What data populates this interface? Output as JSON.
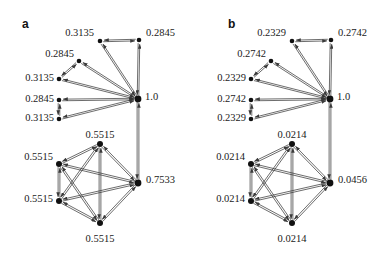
{
  "figure": {
    "width": 384,
    "height": 255,
    "background": "#ffffff",
    "ink_color": "#333333",
    "node_color": "#111111",
    "text_color": "#1a1a1a"
  },
  "panels": [
    {
      "id": "a",
      "label": "a",
      "label_x": 22,
      "label_y": 18,
      "clusters": [
        {
          "id": "a-upper-star",
          "type": "star",
          "hub": {
            "id": "a-hub",
            "x": 138,
            "y": 99,
            "r": 3.4,
            "label": "1.0",
            "label_x": 145,
            "label_y": 97,
            "anchor": "start"
          },
          "leaves": [
            {
              "id": "a-leaf-1",
              "x": 100,
              "y": 41,
              "r": 2.3,
              "label": "0.3135",
              "label_x": 94,
              "label_y": 33,
              "anchor": "end"
            },
            {
              "id": "a-leaf-2",
              "x": 139,
              "y": 40,
              "r": 2.3,
              "label": "0.2845",
              "label_x": 146,
              "label_y": 33,
              "anchor": "start"
            },
            {
              "id": "a-leaf-3",
              "x": 79,
              "y": 61,
              "r": 2.3,
              "label": "0.2845",
              "label_x": 74,
              "label_y": 54,
              "anchor": "end"
            },
            {
              "id": "a-leaf-4",
              "x": 59,
              "y": 79,
              "r": 2.3,
              "label": "0.3135",
              "label_x": 54,
              "label_y": 78,
              "anchor": "end"
            },
            {
              "id": "a-leaf-5",
              "x": 59,
              "y": 100,
              "r": 2.3,
              "label": "0.2845",
              "label_x": 54,
              "label_y": 99,
              "anchor": "end"
            },
            {
              "id": "a-leaf-6",
              "x": 59,
              "y": 119,
              "r": 2.3,
              "label": "0.3135",
              "label_x": 54,
              "label_y": 118,
              "anchor": "end"
            }
          ]
        },
        {
          "id": "a-lower-clique",
          "type": "clique",
          "nodes": [
            {
              "id": "a-c-top",
              "x": 100,
              "y": 144,
              "r": 3.0,
              "label": "0.5515",
              "label_x": 100,
              "label_y": 135,
              "anchor": "mid"
            },
            {
              "id": "a-c-left-upper",
              "x": 59,
              "y": 164,
              "r": 3.0,
              "label": "0.5515",
              "label_x": 53,
              "label_y": 157,
              "anchor": "end"
            },
            {
              "id": "a-c-right",
              "x": 138,
              "y": 183,
              "r": 3.4,
              "label": "0.7533",
              "label_x": 146,
              "label_y": 180,
              "anchor": "start"
            },
            {
              "id": "a-c-left-lower",
              "x": 59,
              "y": 201,
              "r": 3.0,
              "label": "0.5515",
              "label_x": 53,
              "label_y": 199,
              "anchor": "end"
            },
            {
              "id": "a-c-bottom",
              "x": 100,
              "y": 223,
              "r": 3.0,
              "label": "0.5515",
              "label_x": 100,
              "label_y": 239,
              "anchor": "mid"
            }
          ]
        }
      ],
      "bridge": {
        "from": "a-hub",
        "to": "a-c-right",
        "from_x": 138,
        "from_y": 99,
        "to_x": 138,
        "to_y": 183
      }
    },
    {
      "id": "b",
      "label": "b",
      "label_x": 228,
      "label_y": 18,
      "clusters": [
        {
          "id": "b-upper-star",
          "type": "star",
          "hub": {
            "id": "b-hub",
            "x": 330,
            "y": 99,
            "r": 3.4,
            "label": "1.0",
            "label_x": 337,
            "label_y": 97,
            "anchor": "start"
          },
          "leaves": [
            {
              "id": "b-leaf-1",
              "x": 292,
              "y": 41,
              "r": 2.3,
              "label": "0.2329",
              "label_x": 286,
              "label_y": 33,
              "anchor": "end"
            },
            {
              "id": "b-leaf-2",
              "x": 331,
              "y": 40,
              "r": 2.3,
              "label": "0.2742",
              "label_x": 338,
              "label_y": 33,
              "anchor": "start"
            },
            {
              "id": "b-leaf-3",
              "x": 271,
              "y": 61,
              "r": 2.3,
              "label": "0.2742",
              "label_x": 266,
              "label_y": 54,
              "anchor": "end"
            },
            {
              "id": "b-leaf-4",
              "x": 251,
              "y": 79,
              "r": 2.3,
              "label": "0.2329",
              "label_x": 246,
              "label_y": 78,
              "anchor": "end"
            },
            {
              "id": "b-leaf-5",
              "x": 251,
              "y": 100,
              "r": 2.3,
              "label": "0.2742",
              "label_x": 246,
              "label_y": 99,
              "anchor": "end"
            },
            {
              "id": "b-leaf-6",
              "x": 251,
              "y": 119,
              "r": 2.3,
              "label": "0.2329",
              "label_x": 246,
              "label_y": 118,
              "anchor": "end"
            }
          ]
        },
        {
          "id": "b-lower-clique",
          "type": "clique",
          "nodes": [
            {
              "id": "b-c-top",
              "x": 292,
              "y": 144,
              "r": 3.0,
              "label": "0.0214",
              "label_x": 292,
              "label_y": 135,
              "anchor": "mid"
            },
            {
              "id": "b-c-left-upper",
              "x": 251,
              "y": 164,
              "r": 3.0,
              "label": "0.0214",
              "label_x": 245,
              "label_y": 157,
              "anchor": "end"
            },
            {
              "id": "b-c-right",
              "x": 330,
              "y": 183,
              "r": 3.4,
              "label": "0.0456",
              "label_x": 338,
              "label_y": 180,
              "anchor": "start"
            },
            {
              "id": "b-c-left-lower",
              "x": 251,
              "y": 201,
              "r": 3.0,
              "label": "0.0214",
              "label_x": 245,
              "label_y": 199,
              "anchor": "end"
            },
            {
              "id": "b-c-bottom",
              "x": 292,
              "y": 223,
              "r": 3.0,
              "label": "0.0214",
              "label_x": 292,
              "label_y": 239,
              "anchor": "mid"
            }
          ]
        }
      ],
      "bridge": {
        "from": "b-hub",
        "to": "b-c-right",
        "from_x": 330,
        "from_y": 99,
        "to_x": 330,
        "to_y": 183
      }
    }
  ],
  "chart_data": {
    "type": "diagram",
    "diagram_type": "directed-graph",
    "title": "",
    "panel_labels": [
      "a",
      "b"
    ],
    "panels": [
      {
        "label": "a",
        "upper_cluster": {
          "hub_value": 1.0,
          "leaf_values": [
            0.3135,
            0.2845,
            0.2845,
            0.3135,
            0.2845,
            0.3135
          ]
        },
        "lower_cluster": {
          "node_values": [
            0.5515,
            0.5515,
            0.7533,
            0.5515,
            0.5515
          ]
        },
        "bridge_between": [
          "1.0",
          "0.7533"
        ]
      },
      {
        "label": "b",
        "upper_cluster": {
          "hub_value": 1.0,
          "leaf_values": [
            0.2329,
            0.2742,
            0.2742,
            0.2329,
            0.2742,
            0.2329
          ]
        },
        "lower_cluster": {
          "node_values": [
            0.0214,
            0.0214,
            0.0456,
            0.0214,
            0.0214
          ]
        },
        "bridge_between": [
          "1.0",
          "0.0456"
        ]
      }
    ],
    "all_labels_panel_a": [
      "0.3135",
      "0.2845",
      "0.2845",
      "0.3135",
      "0.2845",
      "0.3135",
      "1.0",
      "0.5515",
      "0.5515",
      "0.7533",
      "0.5515",
      "0.5515"
    ],
    "all_labels_panel_b": [
      "0.2329",
      "0.2742",
      "0.2742",
      "0.2329",
      "0.2742",
      "0.2329",
      "1.0",
      "0.0214",
      "0.0214",
      "0.0456",
      "0.0214",
      "0.0214"
    ]
  }
}
